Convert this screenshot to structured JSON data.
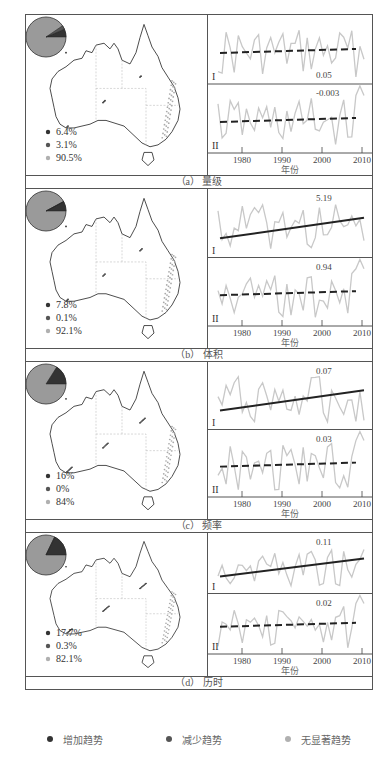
{
  "colors": {
    "increase": "#333333",
    "decrease": "#555555",
    "insignificant": "#b0b0b0",
    "pie_fill": "#9a9a9a",
    "series": "#c8c8c8",
    "trend_line": "#222222",
    "frame": "#555555"
  },
  "axis": {
    "x_ticks": [
      "1980",
      "1990",
      "2000",
      "2010"
    ],
    "x_label": "年份",
    "subpanel_labels": [
      "I",
      "II"
    ]
  },
  "legend": {
    "items": [
      {
        "label": "增加趋势",
        "color": "#333333"
      },
      {
        "label": "减少趋势",
        "color": "#555555"
      },
      {
        "label": "无显著趋势",
        "color": "#b0b0b0"
      }
    ]
  },
  "panels": [
    {
      "id": "a",
      "caption": "（a） 量级",
      "pct": [
        "6.4%",
        "3.1%",
        "90.5%"
      ],
      "slope_I": "0.05",
      "slope_II": "-0.003",
      "trend_I_style": "dashed",
      "trend_II_style": "dashed"
    },
    {
      "id": "b",
      "caption": "（b） 体积",
      "pct": [
        "7.8%",
        "0.1%",
        "92.1%"
      ],
      "slope_I": "5.19",
      "slope_II": "0.94",
      "trend_I_style": "solid",
      "trend_II_style": "dashed"
    },
    {
      "id": "c",
      "caption": "（c） 频率",
      "pct": [
        "16%",
        "0%",
        "84%"
      ],
      "slope_I": "0.07",
      "slope_II": "0.03",
      "trend_I_style": "solid",
      "trend_II_style": "dashed"
    },
    {
      "id": "d",
      "caption": "（d） 历时",
      "pct": [
        "17.7%",
        "0.3%",
        "82.1%"
      ],
      "slope_I": "0.11",
      "slope_II": "0.02",
      "trend_I_style": "solid",
      "trend_II_style": "dashed"
    }
  ],
  "chart_data": [
    {
      "type": "line",
      "title": "（a） 量级",
      "xlabel": "年份",
      "x_range": [
        1975,
        2011
      ],
      "pie": {
        "increase": 6.4,
        "decrease": 3.1,
        "insignificant": 90.5
      },
      "series": [
        {
          "name": "I",
          "trend_slope": 0.05,
          "significant": false
        },
        {
          "name": "II",
          "trend_slope": -0.003,
          "significant": false
        }
      ]
    },
    {
      "type": "line",
      "title": "（b） 体积",
      "xlabel": "年份",
      "x_range": [
        1975,
        2011
      ],
      "pie": {
        "increase": 7.8,
        "decrease": 0.1,
        "insignificant": 92.1
      },
      "series": [
        {
          "name": "I",
          "trend_slope": 5.19,
          "significant": true
        },
        {
          "name": "II",
          "trend_slope": 0.94,
          "significant": false
        }
      ]
    },
    {
      "type": "line",
      "title": "（c） 频率",
      "xlabel": "年份",
      "x_range": [
        1975,
        2011
      ],
      "pie": {
        "increase": 16,
        "decrease": 0,
        "insignificant": 84
      },
      "series": [
        {
          "name": "I",
          "trend_slope": 0.07,
          "significant": true
        },
        {
          "name": "II",
          "trend_slope": 0.03,
          "significant": false
        }
      ]
    },
    {
      "type": "line",
      "title": "（d） 历时",
      "xlabel": "年份",
      "x_range": [
        1975,
        2011
      ],
      "pie": {
        "increase": 17.7,
        "decrease": 0.3,
        "insignificant": 82.1
      },
      "series": [
        {
          "name": "I",
          "trend_slope": 0.11,
          "significant": true
        },
        {
          "name": "II",
          "trend_slope": 0.02,
          "significant": false
        }
      ]
    }
  ]
}
